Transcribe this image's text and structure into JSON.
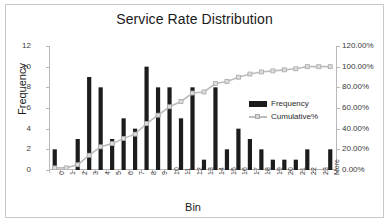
{
  "chart_data": {
    "type": "bar",
    "title": "Service Rate Distribution",
    "xlabel": "Bin",
    "ylabel": "Frequency",
    "y2label": "",
    "grid": false,
    "legend_position": "inside-right",
    "categories": [
      "0",
      "1",
      "2",
      "3",
      "4",
      "5",
      "6",
      "7",
      "8",
      "9",
      "10",
      "11",
      "12",
      "13",
      "14",
      "15",
      "16",
      "17",
      "18",
      "19",
      "20",
      "21",
      "22",
      "23",
      "More"
    ],
    "ylim": [
      0,
      12
    ],
    "yticks": [
      "0",
      "2",
      "4",
      "6",
      "8",
      "10",
      "12"
    ],
    "y2lim": [
      0,
      1.2
    ],
    "y2ticks": [
      "0.00%",
      "20.00%",
      "40.00%",
      "60.00%",
      "80.00%",
      "100.00%",
      "120.00%"
    ],
    "series": [
      {
        "name": "Frequency",
        "type": "bar",
        "axis": "left",
        "color": "#1c1c1c",
        "values": [
          2,
          0,
          3,
          9,
          8,
          3,
          5,
          4,
          10,
          8,
          8,
          5,
          8,
          1,
          8,
          2,
          4,
          3,
          2,
          1,
          1,
          1,
          2,
          0,
          2
        ]
      },
      {
        "name": "Cumulative%",
        "type": "line",
        "axis": "right",
        "color": "#bdbdbd",
        "marker": "square",
        "values": [
          0.0204,
          0.0204,
          0.051,
          0.1429,
          0.2245,
          0.2551,
          0.3061,
          0.3469,
          0.449,
          0.5306,
          0.6122,
          0.6633,
          0.7449,
          0.7551,
          0.8367,
          0.8571,
          0.898,
          0.9286,
          0.949,
          0.9592,
          0.9694,
          0.9796,
          1.0,
          1.0,
          1.0
        ]
      }
    ]
  },
  "legend": {
    "items": [
      {
        "label": "Frequency"
      },
      {
        "label": "Cumulative%"
      }
    ]
  },
  "colors": {
    "bar": "#1c1c1c",
    "line": "#bdbdbd",
    "axis": "#b8b8b8",
    "frame": "#c8c8c8",
    "text": "#1a1a1a"
  }
}
